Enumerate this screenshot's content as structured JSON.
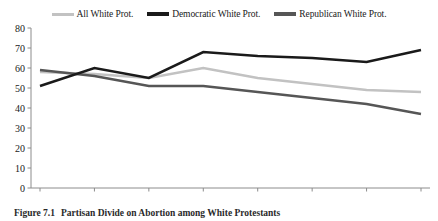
{
  "chart_data": {
    "type": "line",
    "title": "",
    "xlabel": "",
    "ylabel": "",
    "categories": [
      "1980",
      "1984",
      "1988",
      "1992",
      "1996",
      "2000",
      "2004",
      "2008"
    ],
    "x": [
      1980,
      1984,
      1988,
      1992,
      1996,
      2000,
      2004,
      2008
    ],
    "ylim": [
      0,
      80
    ],
    "yticks": [
      0,
      10,
      20,
      30,
      40,
      50,
      60,
      70,
      80
    ],
    "ytick_labels": [
      "0",
      "10",
      "20",
      "30",
      "40",
      "50",
      "60",
      "70",
      "80"
    ],
    "grid": false,
    "legend_position": "top-center",
    "series": [
      {
        "name": "All White Prot.",
        "color": "#c2c2c2",
        "values": [
          58,
          57,
          55,
          60,
          55,
          52,
          49,
          48
        ]
      },
      {
        "name": "Democratic White Prot.",
        "color": "#1a1a1a",
        "values": [
          51,
          60,
          55,
          68,
          66,
          65,
          63,
          69
        ]
      },
      {
        "name": "Republican White Prot.",
        "color": "#565656",
        "values": [
          59,
          56,
          51,
          51,
          48,
          45,
          42,
          37
        ]
      }
    ]
  },
  "legend": {
    "items": [
      {
        "label": "All White Prot.",
        "color": "#c2c2c2"
      },
      {
        "label": "Democratic White Prot.",
        "color": "#1a1a1a"
      },
      {
        "label": "Republican White Prot.",
        "color": "#565656"
      }
    ]
  },
  "axes": {
    "y_labels": [
      "80",
      "70",
      "60",
      "50",
      "40",
      "30",
      "20",
      "10",
      "0"
    ],
    "x_labels": [
      "1980",
      "1984",
      "1988",
      "1992",
      "1996",
      "2000",
      "2004",
      "2008"
    ],
    "axis_color": "#8c8c8c"
  },
  "caption": {
    "number": "Figure 7.1",
    "text": "Partisan Divide on Abortion among White Protestants"
  }
}
